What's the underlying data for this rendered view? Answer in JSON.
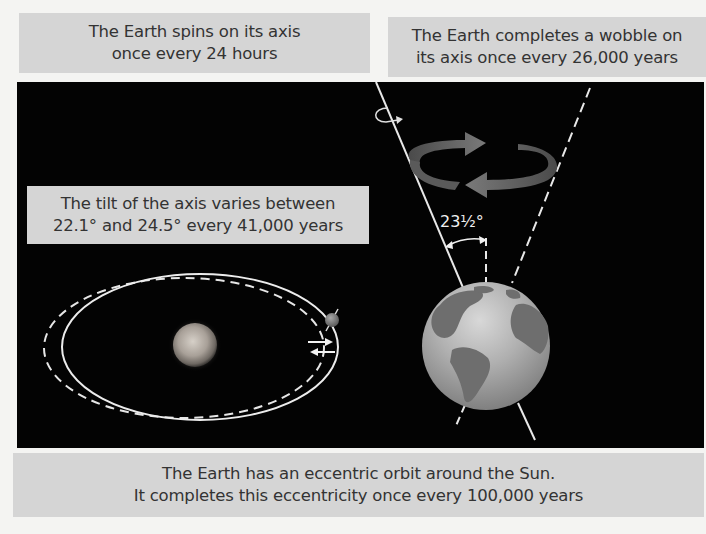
{
  "diagram": {
    "colors": {
      "panel_bg": "#030303",
      "label_bg": "#d5d5d5",
      "label_text": "#333333",
      "line": "#e8e8e8",
      "wobble_arrow": "#6a6a6a",
      "page_bg": "#f4f4f2"
    },
    "labels": {
      "spin": {
        "line1": "The Earth spins on its axis",
        "line2": "once every 24 hours"
      },
      "wobble": {
        "line1": "The Earth completes a wobble on",
        "line2": "its axis once every 26,000 years"
      },
      "tilt": {
        "line1": "The tilt of the axis varies between",
        "line2": "22.1° and 24.5° every 41,000 years"
      },
      "orbit": {
        "line1": "The Earth has an eccentric orbit around the Sun.",
        "line2": "It completes this eccentricity once every 100,000 years"
      }
    },
    "angle_label": "23½°",
    "elements": {
      "sun": "sun-icon",
      "earth_small": "earth-small-icon",
      "earth_globe": "earth-globe-icon",
      "rotation_arrow": "rotation-arrow-icon",
      "wobble_arrows": "wobble-arrows-icon",
      "orbit_solid": "eccentric-orbit",
      "orbit_dashed": "circular-orbit",
      "stretch_arrows": "stretch-arrows-icon"
    }
  }
}
